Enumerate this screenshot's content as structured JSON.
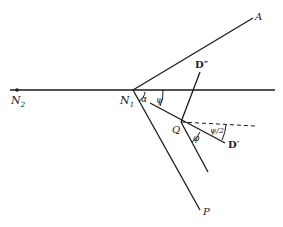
{
  "figure": {
    "width": 283,
    "height": 227,
    "line_color": "#1a1a1a",
    "background": "#ffffff"
  },
  "points": {
    "N2": {
      "label": "N",
      "sub": "2",
      "x": 17,
      "y": 90
    },
    "N1": {
      "label": "N",
      "sub": "1",
      "x": 133,
      "y": 90
    },
    "A": {
      "label": "A",
      "x": 253,
      "y": 18
    },
    "P": {
      "label": "P",
      "x": 200,
      "y": 210
    },
    "Q": {
      "label": "Q",
      "x": 181,
      "y": 122
    },
    "D_prime": {
      "label": "D′",
      "x": 225,
      "y": 143
    },
    "D_double_prime": {
      "label": "D″",
      "x": 200,
      "y": 72
    }
  },
  "angles": {
    "alpha": {
      "label": "α"
    },
    "psi": {
      "label": "ψ"
    },
    "phi": {
      "label": "φ"
    },
    "psi_half": {
      "label": "ψ/2"
    }
  }
}
